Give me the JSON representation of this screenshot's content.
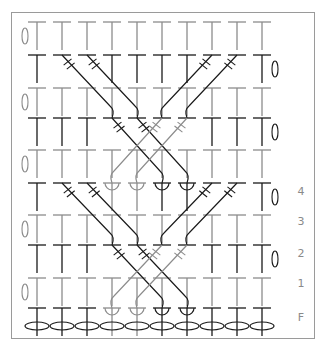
{
  "diagram": {
    "type": "crochet-cable-chart",
    "columns": 10,
    "column_x": [
      37,
      62,
      87,
      112,
      137,
      162,
      187,
      212,
      237,
      262
    ],
    "row_y": [
      22,
      55,
      88,
      118,
      150,
      183,
      215,
      245,
      278,
      308
    ],
    "row_tone": [
      "gray",
      "black",
      "gray",
      "black",
      "gray",
      "black",
      "gray",
      "black",
      "gray",
      "black"
    ],
    "colors": {
      "black": "#1a1a1a",
      "gray": "#8c8c8c",
      "frame": "#9a9a9a",
      "label": "#8a8a8a"
    },
    "foundation_chain_y": 326,
    "turning_chains": [
      {
        "row": 0,
        "side": "left"
      },
      {
        "row": 1,
        "side": "right"
      },
      {
        "row": 2,
        "side": "left"
      },
      {
        "row": 3,
        "side": "right"
      },
      {
        "row": 4,
        "side": "left"
      },
      {
        "row": 5,
        "side": "right"
      },
      {
        "row": 6,
        "side": "left"
      },
      {
        "row": 7,
        "side": "right"
      },
      {
        "row": 8,
        "side": "left"
      }
    ],
    "cables": [
      {
        "from_row": 1,
        "from_col": 1,
        "to_row": 3,
        "to_col": 3,
        "tone": "black"
      },
      {
        "from_row": 1,
        "from_col": 2,
        "to_row": 3,
        "to_col": 4,
        "tone": "black"
      },
      {
        "from_row": 1,
        "from_col": 7,
        "to_row": 3,
        "to_col": 5,
        "tone": "black"
      },
      {
        "from_row": 1,
        "from_col": 8,
        "to_row": 3,
        "to_col": 6,
        "tone": "black"
      },
      {
        "from_row": 3,
        "from_col": 3,
        "to_row": 5,
        "to_col": 5,
        "tone": "black"
      },
      {
        "from_row": 3,
        "from_col": 4,
        "to_row": 5,
        "to_col": 6,
        "tone": "black"
      },
      {
        "from_row": 3,
        "from_col": 5,
        "to_row": 5,
        "to_col": 3,
        "tone": "gray"
      },
      {
        "from_row": 3,
        "from_col": 6,
        "to_row": 5,
        "to_col": 4,
        "tone": "gray"
      },
      {
        "from_row": 5,
        "from_col": 1,
        "to_row": 7,
        "to_col": 3,
        "tone": "black"
      },
      {
        "from_row": 5,
        "from_col": 2,
        "to_row": 7,
        "to_col": 4,
        "tone": "black"
      },
      {
        "from_row": 5,
        "from_col": 7,
        "to_row": 7,
        "to_col": 5,
        "tone": "black"
      },
      {
        "from_row": 5,
        "from_col": 8,
        "to_row": 7,
        "to_col": 6,
        "tone": "black"
      },
      {
        "from_row": 7,
        "from_col": 3,
        "to_row": 9,
        "to_col": 5,
        "tone": "black"
      },
      {
        "from_row": 7,
        "from_col": 4,
        "to_row": 9,
        "to_col": 6,
        "tone": "black"
      },
      {
        "from_row": 7,
        "from_col": 5,
        "to_row": 9,
        "to_col": 3,
        "tone": "gray"
      },
      {
        "from_row": 7,
        "from_col": 6,
        "to_row": 9,
        "to_col": 4,
        "tone": "gray"
      }
    ],
    "row_labels": [
      {
        "text": "4",
        "y": 185
      },
      {
        "text": "3",
        "y": 215
      },
      {
        "text": "2",
        "y": 247
      },
      {
        "text": "1",
        "y": 277
      },
      {
        "text": "F",
        "y": 311
      }
    ]
  }
}
